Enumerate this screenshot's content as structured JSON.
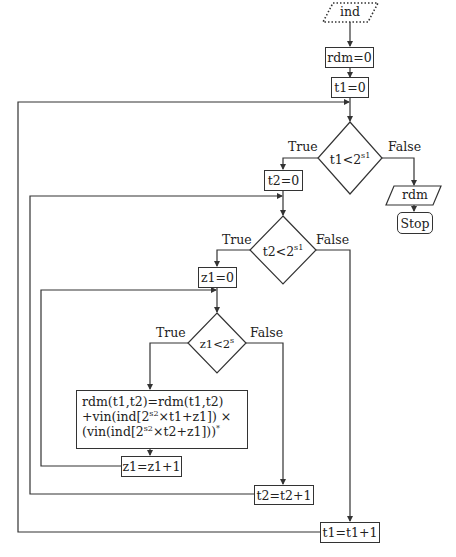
{
  "flowchart": {
    "start": {
      "label": "ind",
      "shape": "parallelogram-dotted"
    },
    "init_rdm": {
      "label": "rdm=0"
    },
    "init_t1": {
      "label": "t1=0"
    },
    "decision_t1": {
      "left": "t1<2",
      "sup": "s1"
    },
    "init_t2": {
      "label": "t2=0"
    },
    "output": {
      "label": "rdm",
      "shape": "parallelogram"
    },
    "stop": {
      "label": "Stop"
    },
    "decision_t2": {
      "left": "t2<2",
      "sup": "s1"
    },
    "init_z1": {
      "label": "z1=0"
    },
    "decision_z1": {
      "left": "z1<2",
      "sup": "s"
    },
    "update": {
      "line1": "rdm(t1,t2)=rdm(t1,t2)",
      "line2_a": "+vin(ind[2",
      "line2_sup": "s2",
      "line2_b": "×t1+z1]) ×",
      "line3_a": "(vin(ind[2",
      "line3_sup": "s2",
      "line3_b": "×t2+z1]))",
      "line3_sup2": "*"
    },
    "inc_z1": {
      "label": "z1=z1+1"
    },
    "inc_t2": {
      "label": "t2=t2+1"
    },
    "inc_t1": {
      "label": "t1=t1+1"
    },
    "edge_labels": {
      "d1_true": "True",
      "d1_false": "False",
      "d2_true": "True",
      "d2_false": "False",
      "d3_true": "True",
      "d3_false": "False"
    }
  },
  "colors": {
    "stroke": "#333333",
    "background": "#ffffff",
    "text": "#222222"
  }
}
